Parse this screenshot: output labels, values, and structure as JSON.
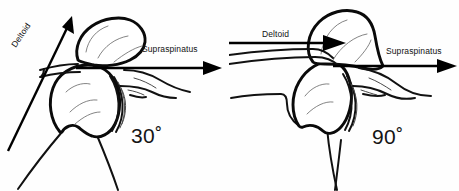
{
  "figure": {
    "background_color": "#fefefe",
    "ink_color": "#111111",
    "width": 459,
    "height": 191
  },
  "panels": [
    {
      "id": "panel-30",
      "angle_label": "30˚",
      "angle_value": 30,
      "vectors": [
        {
          "name": "deltoid",
          "label": "Deltoid",
          "orientation": "oblique-upward",
          "direction_degrees": 56,
          "label_rotated": true
        },
        {
          "name": "supraspinatus",
          "label": "Supraspinatus",
          "orientation": "horizontal",
          "direction_degrees": 0,
          "label_rotated": false
        }
      ],
      "structures": [
        "acromion",
        "clavicle",
        "humeral-head",
        "glenoid",
        "scapula-spine",
        "humeral-shaft"
      ]
    },
    {
      "id": "panel-90",
      "angle_label": "90˚",
      "angle_value": 90,
      "vectors": [
        {
          "name": "deltoid",
          "label": "Deltoid",
          "orientation": "horizontal",
          "direction_degrees": 0,
          "label_rotated": false
        },
        {
          "name": "supraspinatus",
          "label": "Supraspinatus",
          "orientation": "horizontal",
          "direction_degrees": 0,
          "label_rotated": false
        }
      ],
      "structures": [
        "acromion",
        "clavicle",
        "humeral-head",
        "glenoid",
        "scapula-spine",
        "humeral-shaft"
      ]
    }
  ]
}
